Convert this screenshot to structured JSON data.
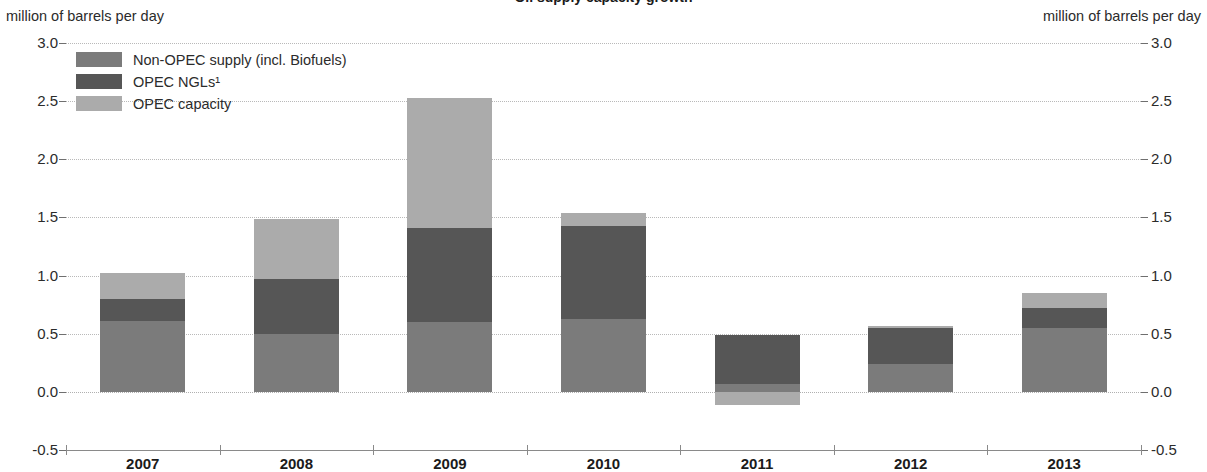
{
  "chart_data": {
    "type": "bar",
    "stacked": true,
    "title": "Oil supply capacity growth",
    "subtitle": "",
    "xlabel": "",
    "ylabel": "million of barrels per day",
    "ylabel_right": "million of barrels per day",
    "categories": [
      "2007",
      "2008",
      "2009",
      "2010",
      "2011",
      "2012",
      "2013"
    ],
    "series": [
      {
        "name": "Non-OPEC supply (incl. Biofuels)",
        "color": "#7b7b7b",
        "values": [
          0.61,
          0.5,
          0.6,
          0.63,
          0.07,
          0.24,
          0.55
        ]
      },
      {
        "name": "OPEC NGLs¹",
        "color": "#565656",
        "values": [
          0.19,
          0.47,
          0.81,
          0.8,
          0.42,
          0.31,
          0.17
        ]
      },
      {
        "name": "OPEC capacity",
        "color": "#ababab",
        "values": [
          0.22,
          0.52,
          1.12,
          0.11,
          -0.11,
          0.02,
          0.13
        ]
      }
    ],
    "totals": [
      1.02,
      1.49,
      2.53,
      1.54,
      0.38,
      0.57,
      0.85
    ],
    "ylim": [
      -0.5,
      3.0
    ],
    "ytick_values": [
      "3.0",
      "2.5",
      "2.0",
      "1.5",
      "1.0",
      "0.5",
      "0.0",
      "-0.5"
    ],
    "ytick_numbers": [
      3.0,
      2.5,
      2.0,
      1.5,
      1.0,
      0.5,
      0.0,
      -0.5
    ],
    "grid": true,
    "legend_position": "top-left",
    "footnote": "¹"
  },
  "legend": {
    "items": [
      {
        "label": "Non-OPEC supply (incl. Biofuels)"
      },
      {
        "label": "OPEC NGLs¹"
      },
      {
        "label": "OPEC capacity"
      }
    ]
  }
}
